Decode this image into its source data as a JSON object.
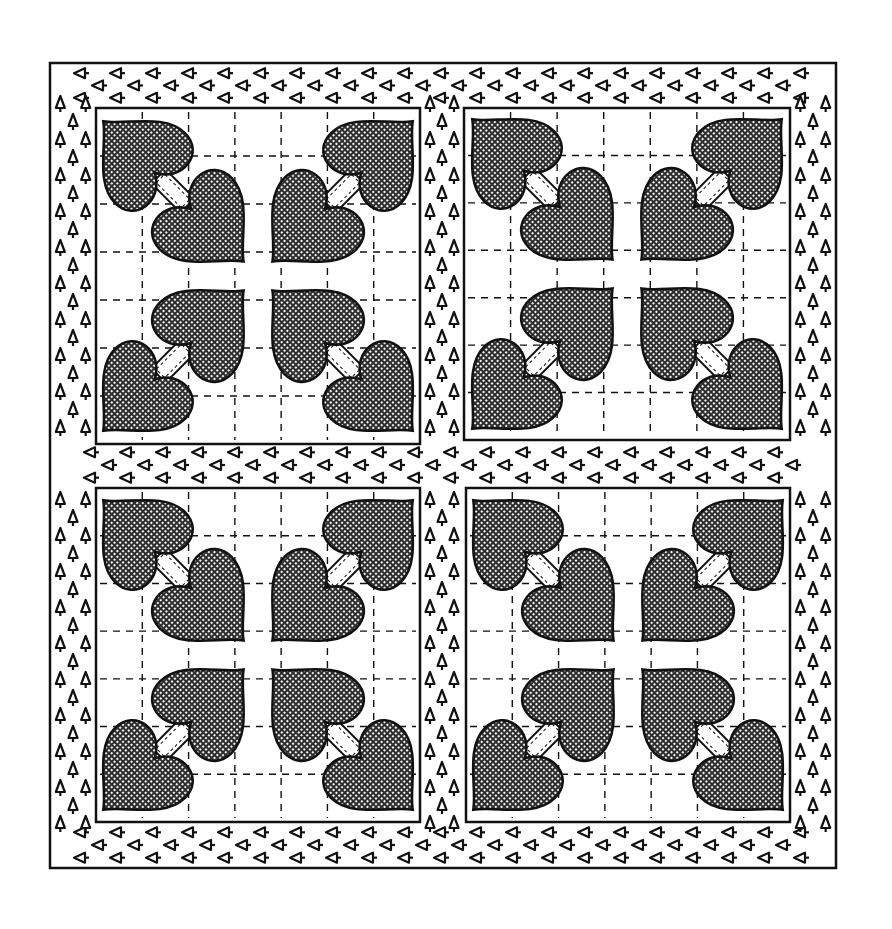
{
  "image": {
    "kind": "line-drawing illustration",
    "subject": "Quilt with four appliqued heart blocks and a sashed triangle-print border",
    "width": 892,
    "height": 929
  },
  "colors": {
    "background": "#ffffff",
    "ink": "#111111",
    "heart_fill": "#3a3a3a",
    "heart_mesh": "#ffffff",
    "block_fill": "#ffffff"
  },
  "quilt": {
    "outer_frame": {
      "x": 50,
      "y": 63,
      "w": 786,
      "h": 805
    },
    "border_motif": "small open triangle arrowheads with tails",
    "blocks": [
      {
        "id": "top-left",
        "x": 96,
        "y": 108,
        "w": 324,
        "h": 336
      },
      {
        "id": "top-right",
        "x": 464,
        "y": 108,
        "w": 326,
        "h": 332
      },
      {
        "id": "bottom-left",
        "x": 96,
        "y": 488,
        "w": 324,
        "h": 334
      },
      {
        "id": "bottom-right",
        "x": 466,
        "y": 488,
        "w": 324,
        "h": 334
      }
    ],
    "block_grid_divisions": 7,
    "hearts_per_block": 8,
    "heart_layout": "4 inner hearts pointing to block center, 4 outer hearts pointing to block corners, joined by stitched stems"
  }
}
